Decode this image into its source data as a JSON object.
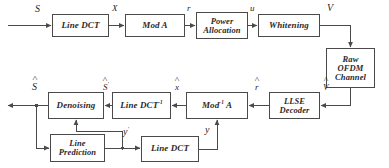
{
  "diagram": {
    "stroke_color": "#4a4a4a",
    "text_color": "#2b2b2b",
    "background": "#ffffff",
    "blocks": [
      {
        "id": "line-dct-tx",
        "lines": [
          "Line DCT"
        ],
        "x": 52,
        "y": 14,
        "w": 57,
        "h": 23,
        "font": "f9"
      },
      {
        "id": "mod-a",
        "lines": [
          "Mod A"
        ],
        "x": 125,
        "y": 14,
        "w": 60,
        "h": 23,
        "font": "f9"
      },
      {
        "id": "power-allocation",
        "lines": [
          "Power",
          "Allocation"
        ],
        "x": 196,
        "y": 12,
        "w": 52,
        "h": 27,
        "font": "f85"
      },
      {
        "id": "whitening",
        "lines": [
          "Whitening"
        ],
        "x": 258,
        "y": 14,
        "w": 62,
        "h": 23,
        "font": "f9"
      },
      {
        "id": "raw-ofdm-channel",
        "lines": [
          "Raw",
          "OFDM",
          "Channel"
        ],
        "x": 326,
        "y": 48,
        "w": 49,
        "h": 40,
        "font": "f85"
      },
      {
        "id": "llse-decoder",
        "lines": [
          "LLSE",
          "Decoder"
        ],
        "x": 269,
        "y": 92,
        "w": 51,
        "h": 27,
        "font": "f85"
      },
      {
        "id": "mod-inv-a",
        "lines": [
          "Mod<sup>-1</sup> A"
        ],
        "x": 186,
        "y": 92,
        "w": 62,
        "h": 27,
        "font": "f9",
        "html": true
      },
      {
        "id": "line-dct-inv",
        "lines": [
          "Line DCT<sup>-1</sup>"
        ],
        "x": 112,
        "y": 92,
        "w": 59,
        "h": 27,
        "font": "f9",
        "html": true
      },
      {
        "id": "denoising",
        "lines": [
          "Denoising"
        ],
        "x": 48,
        "y": 92,
        "w": 56,
        "h": 27,
        "font": "f9"
      },
      {
        "id": "line-prediction",
        "lines": [
          "Line",
          "Prediction"
        ],
        "x": 50,
        "y": 134,
        "w": 55,
        "h": 28,
        "font": "f85"
      },
      {
        "id": "line-dct-fb",
        "lines": [
          "Line DCT"
        ],
        "x": 141,
        "y": 136,
        "w": 58,
        "h": 26,
        "font": "f9"
      }
    ],
    "signals": [
      {
        "id": "s-in",
        "text": "S",
        "hat": false,
        "prime": false,
        "x": 35,
        "y": 4,
        "font": "f10"
      },
      {
        "id": "x-tx",
        "text": "X",
        "hat": false,
        "prime": false,
        "x": 112,
        "y": 4,
        "font": "f9"
      },
      {
        "id": "r-tx",
        "text": "r",
        "hat": false,
        "prime": false,
        "x": 187,
        "y": 4,
        "font": "f9"
      },
      {
        "id": "u-tx",
        "text": "u",
        "hat": false,
        "prime": false,
        "x": 250,
        "y": 4,
        "font": "f9"
      },
      {
        "id": "v-tx",
        "text": "V",
        "hat": false,
        "prime": false,
        "x": 327,
        "y": 3,
        "font": "f10"
      },
      {
        "id": "v-hat-rx",
        "text": "V",
        "hat": true,
        "prime": false,
        "x": 323,
        "y": 83,
        "font": "f9"
      },
      {
        "id": "r-hat-rx",
        "text": "r",
        "hat": true,
        "prime": false,
        "x": 255,
        "y": 83,
        "font": "f9"
      },
      {
        "id": "x-hat-rx",
        "text": "x",
        "hat": true,
        "prime": false,
        "x": 175,
        "y": 83,
        "font": "f9"
      },
      {
        "id": "s-hat-prime",
        "text": "S",
        "hat": true,
        "prime": true,
        "x": 103,
        "y": 83,
        "font": "f9"
      },
      {
        "id": "s-hat-out",
        "text": "S",
        "hat": true,
        "prime": false,
        "x": 32,
        "y": 82,
        "font": "f10"
      },
      {
        "id": "y-fb",
        "text": "y",
        "hat": false,
        "prime": false,
        "x": 205,
        "y": 125,
        "font": "f10"
      },
      {
        "id": "y-prime-fb",
        "text": "y",
        "hat": false,
        "prime": true,
        "x": 123,
        "y": 127,
        "font": "f10"
      }
    ]
  }
}
